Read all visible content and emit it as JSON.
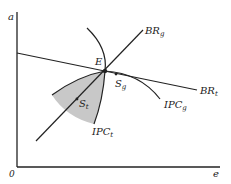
{
  "diagram": {
    "axes": {
      "y_label": "a",
      "x_label": "e",
      "origin_label": "0"
    },
    "curves": [
      {
        "id": "BR_g",
        "label_main": "BR",
        "label_sub": "g"
      },
      {
        "id": "BR_t",
        "label_main": "BR",
        "label_sub": "t"
      },
      {
        "id": "IPC_g",
        "label_main": "IPC",
        "label_sub": "g"
      },
      {
        "id": "IPC_t",
        "label_main": "IPC",
        "label_sub": "t"
      }
    ],
    "points": [
      {
        "id": "E",
        "label": "E"
      },
      {
        "id": "S_g",
        "label_main": "S",
        "label_sub": "g"
      },
      {
        "id": "S_t",
        "label_main": "S",
        "label_sub": "t"
      }
    ],
    "colors": {
      "line": "#222222",
      "shaded_region": "#c8c8c8",
      "background": "#ffffff"
    }
  }
}
